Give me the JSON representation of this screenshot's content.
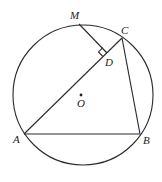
{
  "diagram": {
    "type": "geometry",
    "circle": {
      "center": "O",
      "cx": 83,
      "cy": 95,
      "r": 70
    },
    "points": {
      "A": {
        "label": "A",
        "x": 24,
        "y": 134,
        "lx": 13,
        "ly": 143
      },
      "B": {
        "label": "B",
        "x": 140,
        "y": 134,
        "lx": 143,
        "ly": 144
      },
      "C": {
        "label": "C",
        "x": 122,
        "y": 38,
        "lx": 121,
        "ly": 34
      },
      "M": {
        "label": "M",
        "x": 79,
        "y": 24,
        "lx": 70,
        "ly": 19
      },
      "D": {
        "label": "D",
        "x": 107,
        "y": 53,
        "lx": 105,
        "ly": 66
      },
      "O": {
        "label": "O",
        "x": 81,
        "y": 95,
        "lx": 77,
        "ly": 106
      }
    },
    "segments": [
      [
        "A",
        "B"
      ],
      [
        "B",
        "C"
      ],
      [
        "A",
        "C"
      ],
      [
        "M",
        "D"
      ]
    ],
    "right_angle": {
      "at": "D",
      "between": [
        "M",
        "A"
      ]
    }
  }
}
